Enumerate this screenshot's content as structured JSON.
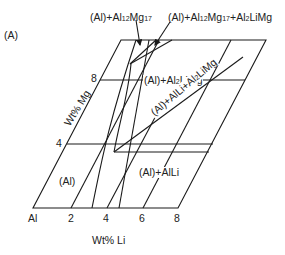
{
  "panel_label": "(A)",
  "axes": {
    "x_label": "Wt% Li",
    "y_label": "Wt% Mg",
    "x_origin_label": "Al",
    "x_ticks": [
      "2",
      "4",
      "6",
      "8"
    ],
    "y_ticks": [
      "4",
      "8"
    ]
  },
  "regions": {
    "al": "(Al)",
    "al_alli": "(Al)+AlLi",
    "al_al2limg": "(Al)+Al2LiMg",
    "al_alli_al2limg": "(Al)+AlLi+Al2LiMg"
  },
  "callouts": {
    "al_al12mg17": {
      "p1": "(Al)+Al",
      "s1": "12",
      "p2": "Mg",
      "s2": "17"
    },
    "al_al12mg17_al2limg": {
      "p1": "(Al)+Al",
      "s1": "12",
      "p2": "Mg",
      "s2": "17",
      "p3": "+Al",
      "s3": "2",
      "p4": "LiMg"
    }
  },
  "rotated": {
    "p1": "(Al)+AlLi+Al",
    "s1": "2",
    "p2": "LiMg"
  },
  "al2limg": {
    "p1": "(Al)+Al",
    "s1": "2",
    "p2": "LiMg"
  },
  "line_color": "#1a1a1a"
}
